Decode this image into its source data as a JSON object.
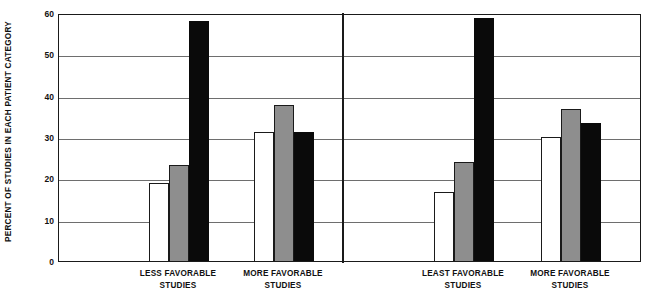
{
  "chart_data": {
    "type": "bar",
    "title": "",
    "subtitle": "",
    "xlabel": "",
    "ylabel": "PERCENT OF STUDIES IN EACH PATIENT CATEGORY",
    "ylim": [
      0,
      60
    ],
    "yticks": [
      0,
      10,
      20,
      30,
      40,
      50,
      60
    ],
    "ytick_labels": [
      "0",
      "10",
      "20",
      "30",
      "40",
      "50",
      "60"
    ],
    "grid": "horizontal",
    "legend": "none",
    "legend_position": "none",
    "panels": [
      {
        "name": "panel-left",
        "categories": [
          {
            "line1": "LESS FAVORABLE",
            "line2": "STUDIES"
          },
          {
            "line1": "MORE FAVORABLE",
            "line2": "STUDIES"
          }
        ]
      },
      {
        "name": "panel-right",
        "categories": [
          {
            "line1": "LEAST FAVORABLE",
            "line2": "STUDIES"
          },
          {
            "line1": "MORE FAVORABLE",
            "line2": "STUDIES"
          }
        ]
      }
    ],
    "series": [
      {
        "name": "white",
        "color": "#ffffff",
        "values": [
          18.8,
          31.2,
          16.7,
          30.0
        ]
      },
      {
        "name": "gray",
        "color": "#8e8e8e",
        "values": [
          23.2,
          37.7,
          24.0,
          36.8
        ]
      },
      {
        "name": "black",
        "color": "#0a0a0a",
        "values": [
          58.0,
          31.2,
          58.8,
          33.5
        ]
      }
    ],
    "group_labels": [
      "LESS FAVORABLE STUDIES",
      "MORE FAVORABLE STUDIES",
      "LEAST FAVORABLE STUDIES",
      "MORE FAVORABLE STUDIES"
    ],
    "bars": [
      {
        "group": 0,
        "series": "white",
        "value": 18.8
      },
      {
        "group": 0,
        "series": "gray",
        "value": 23.2
      },
      {
        "group": 0,
        "series": "black",
        "value": 58.0
      },
      {
        "group": 1,
        "series": "white",
        "value": 31.2
      },
      {
        "group": 1,
        "series": "gray",
        "value": 37.7
      },
      {
        "group": 1,
        "series": "black",
        "value": 31.2
      },
      {
        "group": 2,
        "series": "white",
        "value": 16.7
      },
      {
        "group": 2,
        "series": "gray",
        "value": 24.0
      },
      {
        "group": 2,
        "series": "black",
        "value": 58.8
      },
      {
        "group": 3,
        "series": "white",
        "value": 30.0
      },
      {
        "group": 3,
        "series": "gray",
        "value": 36.8
      },
      {
        "group": 3,
        "series": "black",
        "value": 33.5
      }
    ],
    "layout": {
      "plot_left": 58,
      "plot_top": 14,
      "plot_width": 583,
      "plot_height": 248,
      "panel_divider_x": 283,
      "bar_width": 20,
      "group_centers": [
        120,
        225,
        405,
        512
      ]
    },
    "colors": {
      "axis": "#1a1a1a",
      "gridline": "#6e6e6e",
      "background": "#ffffff",
      "text": "#111111"
    }
  }
}
